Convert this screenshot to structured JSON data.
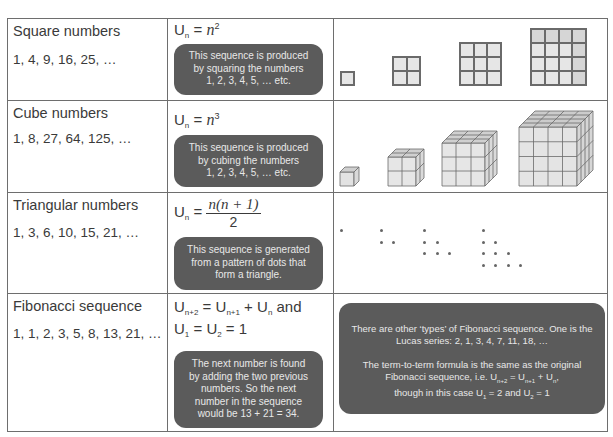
{
  "rows": [
    {
      "name": "Square numbers",
      "sequence": "1, 4, 9, 16, 25, …",
      "formula": {
        "lhs": "U",
        "lhs_sub": "n",
        "eq": " = ",
        "var": "n",
        "exp": "2"
      },
      "note": [
        "This sequence is produced",
        "by squaring the numbers",
        "1, 2, 3, 4, 5, … etc."
      ],
      "illustration": "square-grids-1x1-to-4x4"
    },
    {
      "name": "Cube numbers",
      "sequence": "1, 8, 27, 64, 125, …",
      "formula": {
        "lhs": "U",
        "lhs_sub": "n",
        "eq": " = ",
        "var": "n",
        "exp": "3"
      },
      "note": [
        "This sequence is produced",
        "by cubing the numbers",
        "1, 2, 3, 4, 5, … etc."
      ],
      "illustration": "cubes-1-to-4"
    },
    {
      "name": "Triangular numbers",
      "sequence": "1, 3, 6, 10, 15, 21, …",
      "formula": {
        "lhs": "U",
        "lhs_sub": "n",
        "eq": " = ",
        "numerator": "n(n + 1)",
        "denominator": "2"
      },
      "note": [
        "This sequence is generated",
        "from a pattern of dots that",
        "form a triangle."
      ],
      "illustration": "dot-triangles-1-to-4"
    },
    {
      "name": "Fibonacci sequence",
      "sequence": "1, 1, 2, 3, 5, 8, 13, 21, …",
      "formula_line1": {
        "a": "U",
        "a_sub": "n+2",
        "eq": " = ",
        "b": "U",
        "b_sub": "n+1",
        "plus": " + ",
        "c": "U",
        "c_sub": "n",
        "and": " and"
      },
      "formula_line2": {
        "a": "U",
        "a_sub": "1",
        "eq1": " = ",
        "b": "U",
        "b_sub": "2",
        "eq2": " = 1"
      },
      "note": [
        "The next number is found",
        "by adding the two previous",
        "numbers. So the next",
        "number in the sequence",
        "would be 13 + 21 = 34."
      ],
      "extra_note": {
        "p1": [
          "There are other ‘types’ of Fibonacci sequence. One is the",
          "Lucas series: 2, 1, 3, 4, 7, 11, 18, …"
        ],
        "p2_line1": "The term-to-term formula is the same as the original",
        "p2_line2": {
          "pre": "Fibonacci sequence, i.e. ",
          "a": "U",
          "a_sub": "n+2",
          "eq": " = ",
          "b": "U",
          "b_sub": "n+1",
          "plus": " + ",
          "c": "U",
          "c_sub": "n",
          "post": ","
        },
        "p2_line3": {
          "pre": "though in this case ",
          "a": "U",
          "a_sub": "1",
          "mid": " = 2 and ",
          "b": "U",
          "b_sub": "2",
          "post": " = 1"
        }
      }
    }
  ],
  "colors": {
    "border": "#6e6e6e",
    "bubble": "#5b5b5b",
    "bubble_text": "#e8e8e8",
    "cell_fill": "#e6e6e6",
    "text": "#3a3a3a"
  }
}
